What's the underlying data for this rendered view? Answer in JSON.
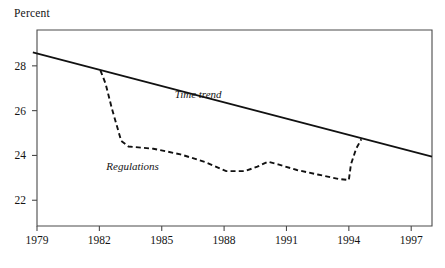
{
  "figure": {
    "axis_label_top": "Percent",
    "background_color": "#ffffff",
    "axis_color": "#4a4a4a",
    "line_color": "#111111"
  },
  "chart_data": {
    "type": "line",
    "title": "",
    "subtitle": "",
    "xlabel": "",
    "ylabel": "Percent",
    "xlim": [
      1979,
      1998
    ],
    "ylim": [
      20.85,
      29.6
    ],
    "xticks": [
      1979,
      1982,
      1985,
      1988,
      1991,
      1994,
      1997
    ],
    "xtick_labels": [
      "1979",
      "1982",
      "1985",
      "1988",
      "1991",
      "1994",
      "1997"
    ],
    "yticks": [
      22,
      24,
      26,
      28
    ],
    "ytick_labels": [
      "22",
      "24",
      "26",
      "28"
    ],
    "grid": false,
    "legend": "inline-annotations",
    "annotations": [
      {
        "text": "Time trend",
        "x": 1986.75,
        "y": 26.55,
        "style": "italic"
      },
      {
        "text": "Regulations",
        "x": 1983.6,
        "y": 23.35,
        "style": "italic"
      }
    ],
    "series": [
      {
        "name": "Time trend",
        "style": "solid",
        "color": "#111111",
        "x": [
          1978.8,
          1998.0
        ],
        "values": [
          28.6,
          23.95
        ]
      },
      {
        "name": "Regulations",
        "style": "dashed",
        "color": "#111111",
        "x": [
          1982.05,
          1982.3,
          1982.6,
          1983.05,
          1983.4,
          1984.6,
          1985.9,
          1987.1,
          1988.1,
          1989.0,
          1989.6,
          1990.1,
          1990.6,
          1991.5,
          1992.5,
          1993.5,
          1994.0,
          1994.1,
          1994.35,
          1994.6
        ],
        "values": [
          27.8,
          27.2,
          26.1,
          24.65,
          24.4,
          24.3,
          24.05,
          23.7,
          23.3,
          23.3,
          23.5,
          23.72,
          23.6,
          23.35,
          23.15,
          22.95,
          22.9,
          23.6,
          24.3,
          24.72
        ]
      }
    ]
  }
}
